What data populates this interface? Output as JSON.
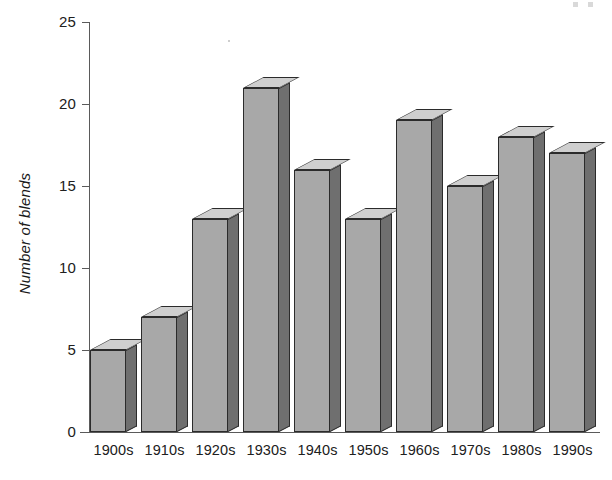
{
  "chart_data": {
    "type": "bar",
    "title": "",
    "subtitle": "",
    "xlabel": "",
    "ylabel": "Number of blends",
    "categories": [
      "1900s",
      "1910s",
      "1920s",
      "1930s",
      "1940s",
      "1950s",
      "1960s",
      "1970s",
      "1980s",
      "1990s"
    ],
    "values": [
      5,
      7,
      13,
      21,
      16,
      13,
      19,
      15,
      18,
      17
    ],
    "ylim": [
      0,
      25
    ],
    "yticks": [
      0,
      5,
      10,
      15,
      20,
      25
    ],
    "ytick_labels": [
      "0",
      "5",
      "10",
      "15",
      "20",
      "25"
    ],
    "grid": false,
    "legend": false,
    "style": "3d-shaded-bars",
    "colors": {
      "bar_front": "#a8a8a8",
      "bar_side": "#6f6f6f",
      "bar_top": "#cfcfcf",
      "bar_outline": "#2b2b2b",
      "axis": "#5a5a5a",
      "text": "#202020",
      "background": "#ffffff"
    }
  },
  "axes": {
    "y_title": "Number of blends",
    "y_labels": {
      "t0": "0",
      "t5": "5",
      "t10": "10",
      "t15": "15",
      "t20": "20",
      "t25": "25"
    },
    "x_labels": {
      "c0": "1900s",
      "c1": "1910s",
      "c2": "1920s",
      "c3": "1930s",
      "c4": "1940s",
      "c5": "1950s",
      "c6": "1960s",
      "c7": "1970s",
      "c8": "1980s",
      "c9": "1990s"
    }
  }
}
